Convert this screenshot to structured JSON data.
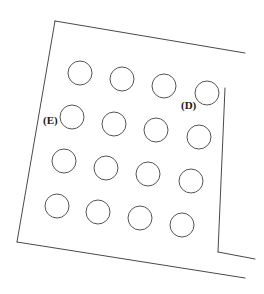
{
  "figure": {
    "background_color": "#ffffff",
    "line_color": "#4a4a4a",
    "hole_stroke_color": "#555555",
    "label_color": "#1a1a1a",
    "stroke_width": 1
  },
  "plate": {
    "name": "plate-outline",
    "description": "Quadrilateral sheet outline rotated slightly clockwise with a notched lower-right corner",
    "segments": [
      {
        "name": "top-edge",
        "x1": 55,
        "y1": 21,
        "x2": 245,
        "y2": 53
      },
      {
        "name": "right-edge",
        "x1": 225,
        "y1": 88,
        "x2": 218,
        "y2": 252
      },
      {
        "name": "notch-edge",
        "x1": 218,
        "y1": 252,
        "x2": 255,
        "y2": 259
      },
      {
        "name": "bottom-edge",
        "x1": 17,
        "y1": 242,
        "x2": 245,
        "y2": 278
      },
      {
        "name": "left-edge",
        "x1": 55,
        "y1": 21,
        "x2": 17,
        "y2": 242
      }
    ]
  },
  "holes": {
    "name": "hole-grid",
    "rows": 4,
    "columns": 4,
    "count": 16,
    "radius": 12,
    "items": [
      {
        "id": "hole-r1c1",
        "cx": 80,
        "cy": 73,
        "r": 12
      },
      {
        "id": "hole-r1c2",
        "cx": 122,
        "cy": 79,
        "r": 12
      },
      {
        "id": "hole-r1c3",
        "cx": 164,
        "cy": 86,
        "r": 12
      },
      {
        "id": "hole-r1c4",
        "cx": 207,
        "cy": 93,
        "r": 12
      },
      {
        "id": "hole-r2c1",
        "cx": 72,
        "cy": 117,
        "r": 12
      },
      {
        "id": "hole-r2c2",
        "cx": 114,
        "cy": 124,
        "r": 12
      },
      {
        "id": "hole-r2c3",
        "cx": 156,
        "cy": 130,
        "r": 12
      },
      {
        "id": "hole-r2c4",
        "cx": 199,
        "cy": 137,
        "r": 12
      },
      {
        "id": "hole-r3c1",
        "cx": 64,
        "cy": 161,
        "r": 12
      },
      {
        "id": "hole-r3c2",
        "cx": 106,
        "cy": 168,
        "r": 12
      },
      {
        "id": "hole-r3c3",
        "cx": 148,
        "cy": 174,
        "r": 12
      },
      {
        "id": "hole-r3c4",
        "cx": 191,
        "cy": 181,
        "r": 12
      },
      {
        "id": "hole-r4c1",
        "cx": 57,
        "cy": 206,
        "r": 12
      },
      {
        "id": "hole-r4c2",
        "cx": 98,
        "cy": 212,
        "r": 12
      },
      {
        "id": "hole-r4c3",
        "cx": 140,
        "cy": 218,
        "r": 12
      },
      {
        "id": "hole-r4c4",
        "cx": 182,
        "cy": 225,
        "r": 12
      }
    ]
  },
  "callouts": [
    {
      "id": "callout-e",
      "label": "(E)",
      "x": 43,
      "y": 124,
      "anchor": "start",
      "target_hole": "hole-r2c1"
    },
    {
      "id": "callout-d",
      "label": "(D)",
      "x": 181,
      "y": 109,
      "anchor": "start",
      "target_hole": "hole-r1c4"
    }
  ]
}
